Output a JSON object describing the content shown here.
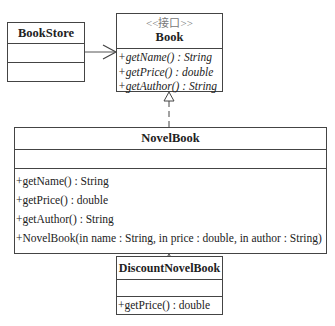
{
  "diagram": {
    "type": "UML class diagram",
    "classes": {
      "bookstore": {
        "name": "BookStore",
        "attributes": [],
        "operations": []
      },
      "book": {
        "stereotype": "<<接口>>",
        "name": "Book",
        "operations": [
          "+getName() : String",
          "+getPrice() : double",
          "+getAuthor() : String"
        ]
      },
      "novelbook": {
        "name": "NovelBook",
        "attributes": [],
        "operations": [
          "+getName() : String",
          "+getPrice() : double",
          "+getAuthor() : String",
          "+NovelBook(in name : String, in price : double, in author : String)"
        ]
      },
      "discountnovelbook": {
        "name": "DiscountNovelBook",
        "attributes": [],
        "operations": [
          "+getPrice() : double"
        ]
      }
    },
    "relationships": [
      {
        "from": "BookStore",
        "to": "Book",
        "kind": "association (open arrow)"
      },
      {
        "from": "NovelBook",
        "to": "Book",
        "kind": "realization (dashed, hollow triangle)"
      },
      {
        "from": "DiscountNovelBook",
        "to": "NovelBook",
        "kind": "generalization (solid, hollow triangle)"
      }
    ],
    "colors": {
      "line": "#444444",
      "stereotype": "#777777",
      "background": "#ffffff"
    }
  }
}
